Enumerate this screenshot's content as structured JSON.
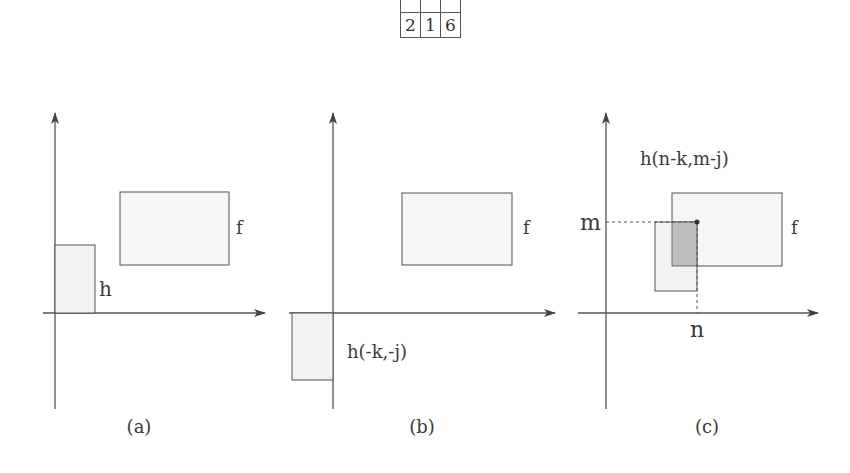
{
  "table": {
    "rows": [
      [
        "",
        "",
        ""
      ],
      [
        "2",
        "1",
        "6"
      ]
    ]
  },
  "panels": [
    {
      "id": "a",
      "caption": "(a)",
      "labels": {
        "f": "f",
        "h": "h"
      }
    },
    {
      "id": "b",
      "caption": "(b)",
      "labels": {
        "f": "f",
        "h": "h(-k,-j)"
      }
    },
    {
      "id": "c",
      "caption": "(c)",
      "labels": {
        "f": "f",
        "h": "h(n-k,m-j)",
        "m": "m",
        "n": "n"
      }
    }
  ],
  "colors": {
    "line": "#555555",
    "rect_fill": "#f4f4f4",
    "overlap_fill": "#bdbdbd"
  }
}
